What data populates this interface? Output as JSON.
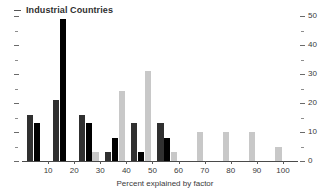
{
  "chart": {
    "title": "Industrial Countries",
    "xlabel": "Percent explained by factor",
    "ylabel": ""
  },
  "chart_data": {
    "type": "bar",
    "title": "Industrial Countries",
    "xlabel": "Percent explained by factor",
    "ylabel": "",
    "xlim": [
      0,
      105
    ],
    "ylim": [
      0,
      50
    ],
    "grid": false,
    "legend": "none",
    "xticks": [
      10,
      20,
      30,
      40,
      50,
      60,
      70,
      80,
      90,
      100
    ],
    "yticks": [
      0,
      10,
      20,
      30,
      40,
      50
    ],
    "yticks_minor": [
      5,
      15,
      25,
      35,
      45
    ],
    "bin_centers": [
      10,
      20,
      30,
      40,
      50,
      60,
      70,
      80,
      90,
      100
    ],
    "series": [
      {
        "name": "series-1",
        "color": "#303030",
        "values": [
          16,
          21,
          16,
          3,
          13,
          13,
          0,
          0,
          0,
          0
        ]
      },
      {
        "name": "series-2",
        "color": "#000000",
        "values": [
          13,
          49,
          13,
          8,
          3,
          8,
          0,
          0,
          0,
          0
        ]
      },
      {
        "name": "series-3",
        "color": "#c8c8c8",
        "values": [
          0,
          0,
          3,
          24,
          31,
          3,
          10,
          10,
          10,
          5
        ]
      }
    ]
  }
}
